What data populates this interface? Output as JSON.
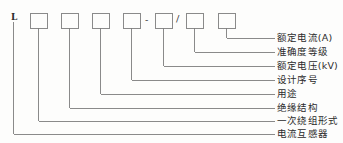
{
  "diagram": {
    "prefix": {
      "letter": "L"
    },
    "separators": [
      {
        "glyph": "-",
        "name": "dash-separator"
      },
      {
        "glyph": "/",
        "name": "slash-separator"
      }
    ],
    "boxes": [
      {
        "index": 1,
        "value": ""
      },
      {
        "index": 2,
        "value": ""
      },
      {
        "index": 3,
        "value": ""
      },
      {
        "index": 4,
        "value": ""
      },
      {
        "index": 5,
        "value": ""
      },
      {
        "index": 6,
        "value": ""
      },
      {
        "index": 7,
        "value": ""
      }
    ],
    "labels": [
      {
        "id": "rated-current",
        "text": "额定电流(A)"
      },
      {
        "id": "accuracy-class",
        "text": "准确度等级"
      },
      {
        "id": "rated-voltage",
        "text": "额定电压(kV)"
      },
      {
        "id": "design-serial",
        "text": "设计序号"
      },
      {
        "id": "usage",
        "text": "用途"
      },
      {
        "id": "insulation",
        "text": "绝缘结构"
      },
      {
        "id": "primary-winding",
        "text": "一次绕组形式"
      },
      {
        "id": "device-name",
        "text": "电流互感器"
      }
    ],
    "colors": {
      "line": "#7d7d7d",
      "box_stroke": "#8a8a8a",
      "text": "#2b2b2b",
      "background": "#fdfdfc"
    }
  }
}
